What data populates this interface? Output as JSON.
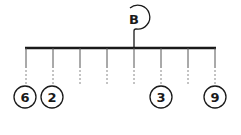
{
  "diagram": {
    "type": "balance-mobile",
    "hanger_label": "B",
    "pivot_index": 4,
    "hook_count": 8,
    "weights": [
      {
        "position": 0,
        "value": "6"
      },
      {
        "position": 1,
        "value": "2"
      },
      {
        "position": 5,
        "value": "3"
      },
      {
        "position": 7,
        "value": "9"
      }
    ],
    "colors": {
      "stroke": "#1a1a1a",
      "dashed": "#888888",
      "background": "#ffffff"
    }
  }
}
